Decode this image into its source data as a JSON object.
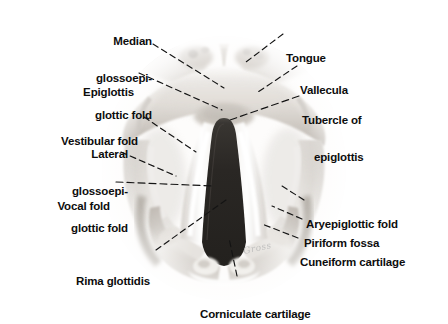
{
  "figure": {
    "image_kind": "grayscale-photograph",
    "signature": "Gross",
    "colors": {
      "background": "#ffffff",
      "label_text": "#0d0d0d",
      "leader_line": "#141414",
      "glottis_dark": "#2b2b2b",
      "tissue_mid": "#b9b4ae",
      "tissue_light": "#ededea"
    }
  },
  "labels": [
    {
      "id": "median-glossoepiglottic-fold",
      "lines": [
        "Median",
        "glossoepi-",
        "glottic fold"
      ],
      "side": "left",
      "align": "right"
    },
    {
      "id": "epiglottis",
      "lines": [
        "Epiglottis"
      ],
      "side": "left",
      "align": "right"
    },
    {
      "id": "vestibular-fold",
      "lines": [
        "Vestibular fold"
      ],
      "side": "left",
      "align": "right"
    },
    {
      "id": "lateral-glossoepiglottic-fold",
      "lines": [
        "Lateral",
        "glossoepi-",
        "glottic fold"
      ],
      "side": "left",
      "align": "right"
    },
    {
      "id": "vocal-fold",
      "lines": [
        "Vocal fold"
      ],
      "side": "left",
      "align": "right"
    },
    {
      "id": "rima-glottidis",
      "lines": [
        "Rima glottidis"
      ],
      "side": "left",
      "align": "right"
    },
    {
      "id": "tongue",
      "lines": [
        "Tongue"
      ],
      "side": "right",
      "align": "left"
    },
    {
      "id": "vallecula",
      "lines": [
        "Vallecula"
      ],
      "side": "right",
      "align": "left"
    },
    {
      "id": "tubercle-of-epiglottis",
      "lines": [
        "Tubercle of",
        "epiglottis"
      ],
      "side": "right",
      "align": "left"
    },
    {
      "id": "aryepiglottic-fold",
      "lines": [
        "Aryepiglottic fold"
      ],
      "side": "right",
      "align": "left"
    },
    {
      "id": "piriform-fossa",
      "lines": [
        "Piriform fossa"
      ],
      "side": "right",
      "align": "left"
    },
    {
      "id": "cuneiform-cartilage",
      "lines": [
        "Cuneiform cartilage"
      ],
      "side": "right",
      "align": "left"
    },
    {
      "id": "corniculate-cartilage",
      "lines": [
        "Corniculate cartilage"
      ],
      "side": "bottom",
      "align": "left"
    }
  ],
  "text": {
    "median_glossoepiglottic_fold_1": "Median",
    "median_glossoepiglottic_fold_2": "glossoepi-",
    "median_glossoepiglottic_fold_3": "glottic fold",
    "epiglottis": "Epiglottis",
    "vestibular_fold": "Vestibular fold",
    "lateral_glossoepiglottic_fold_1": "Lateral",
    "lateral_glossoepiglottic_fold_2": "glossoepi-",
    "lateral_glossoepiglottic_fold_3": "glottic fold",
    "vocal_fold": "Vocal fold",
    "rima_glottidis": "Rima glottidis",
    "tongue": "Tongue",
    "vallecula": "Vallecula",
    "tubercle_of_epiglottis_1": "Tubercle of",
    "tubercle_of_epiglottis_2": "epiglottis",
    "aryepiglottic_fold": "Aryepiglottic fold",
    "piriform_fossa": "Piriform fossa",
    "cuneiform_cartilage": "Cuneiform cartilage",
    "corniculate_cartilage": "Corniculate cartilage",
    "signature": "Gross"
  }
}
